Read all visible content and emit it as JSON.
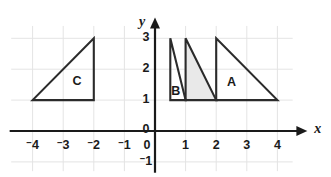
{
  "chart_data": {
    "type": "scatter",
    "title": "",
    "xlabel": "x",
    "ylabel": "y",
    "xlim": [
      -4.8,
      4.6
    ],
    "ylim": [
      -1.4,
      3.5
    ],
    "grid": true,
    "legend": "none",
    "x_ticks": [
      {
        "value": -4,
        "label": "4",
        "negative": true
      },
      {
        "value": -3,
        "label": "3",
        "negative": true
      },
      {
        "value": -2,
        "label": "2",
        "negative": true
      },
      {
        "value": -1,
        "label": "1",
        "negative": true
      },
      {
        "value": 0,
        "label": "0",
        "negative": false
      },
      {
        "value": 1,
        "label": "1",
        "negative": false
      },
      {
        "value": 2,
        "label": "2",
        "negative": false
      },
      {
        "value": 3,
        "label": "3",
        "negative": false
      },
      {
        "value": 4,
        "label": "4",
        "negative": false
      }
    ],
    "y_ticks": [
      {
        "value": 3,
        "label": "3",
        "negative": false
      },
      {
        "value": 2,
        "label": "2",
        "negative": false
      },
      {
        "value": 1,
        "label": "1",
        "negative": false
      },
      {
        "value": 0,
        "label": "0",
        "negative": false
      },
      {
        "value": -1,
        "label": "1",
        "negative": true
      }
    ],
    "shapes": [
      {
        "name": "A",
        "label": "A",
        "label_x": 2.5,
        "label_y": 1.55,
        "filled": false,
        "fill_color": "none",
        "stroke_color": "#2b2b2b",
        "vertices": [
          [
            2,
            1
          ],
          [
            2,
            3
          ],
          [
            4,
            1
          ]
        ]
      },
      {
        "name": "shaded",
        "label": "",
        "label_x": 0,
        "label_y": 0,
        "filled": true,
        "fill_color": "#e9e9e9",
        "stroke_color": "#2b2b2b",
        "vertices": [
          [
            1,
            1
          ],
          [
            1,
            3
          ],
          [
            2,
            1
          ]
        ]
      },
      {
        "name": "B",
        "label": "B",
        "label_x": 0.68,
        "label_y": 1.28,
        "filled": false,
        "fill_color": "none",
        "stroke_color": "#2b2b2b",
        "vertices": [
          [
            0.5,
            1
          ],
          [
            0.5,
            3
          ],
          [
            1,
            1
          ]
        ]
      },
      {
        "name": "C",
        "label": "C",
        "label_x": -2.55,
        "label_y": 1.6,
        "filled": false,
        "fill_color": "none",
        "stroke_color": "#2b2b2b",
        "vertices": [
          [
            -4,
            1
          ],
          [
            -2,
            1
          ],
          [
            -2,
            3
          ]
        ]
      }
    ]
  },
  "axes": {
    "x_axis_name": "x",
    "y_axis_name": "y",
    "origin_x_label": "0",
    "origin_y_label": "0"
  },
  "colors": {
    "background": "#ffffff",
    "grid": "#e4e4e4",
    "axis": "#1a1a1a",
    "stroke": "#2b2b2b",
    "shaded_fill": "#e9e9e9",
    "text": "#1a1a1a"
  }
}
